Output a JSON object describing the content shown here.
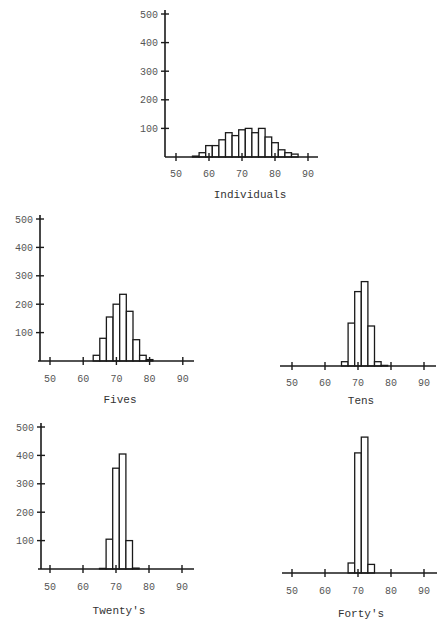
{
  "figure": {
    "width": 445,
    "height": 626,
    "ink_color": "#1a1a1a",
    "label_color": "#555555"
  },
  "chart_data": [
    {
      "type": "bar",
      "title": "Individuals",
      "xlabel": "Individuals",
      "ylabel": "",
      "xticks": [
        50,
        60,
        70,
        80,
        90
      ],
      "yticks": [
        100,
        200,
        300,
        400,
        500
      ],
      "ylim": [
        0,
        500
      ],
      "xlim": [
        47,
        93
      ],
      "show_yaxis": true,
      "bin_width": 2,
      "categories": [
        56,
        58,
        60,
        62,
        64,
        66,
        68,
        70,
        72,
        74,
        76,
        78,
        80,
        82,
        84,
        86
      ],
      "values": [
        3,
        15,
        40,
        40,
        60,
        85,
        75,
        95,
        100,
        85,
        100,
        70,
        50,
        25,
        15,
        10
      ],
      "layout": {
        "axis_x": 165,
        "baseline_y": 157,
        "x50": 176,
        "px_per_10": 33,
        "px_per_100": 28.6,
        "axis_left": 165,
        "axis_right": 318,
        "label_y": 177,
        "title_y": 198,
        "title_x": 250
      }
    },
    {
      "type": "bar",
      "title": "Fives",
      "xlabel": "Fives",
      "ylabel": "",
      "xticks": [
        50,
        60,
        70,
        80,
        90
      ],
      "yticks": [
        100,
        200,
        300,
        400,
        500
      ],
      "ylim": [
        0,
        500
      ],
      "xlim": [
        47,
        93
      ],
      "show_yaxis": true,
      "bin_width": 2,
      "categories": [
        64,
        66,
        68,
        70,
        72,
        74,
        76,
        78,
        80
      ],
      "values": [
        20,
        80,
        155,
        200,
        235,
        175,
        75,
        20,
        5
      ],
      "layout": {
        "axis_x": 40,
        "baseline_y": 361,
        "x50": 50,
        "px_per_10": 33.2,
        "px_per_100": 28.4,
        "axis_left": 38,
        "axis_right": 194,
        "label_y": 382,
        "title_y": 403,
        "title_x": 120
      }
    },
    {
      "type": "bar",
      "title": "Tens",
      "xlabel": "Tens",
      "ylabel": "",
      "xticks": [
        50,
        60,
        70,
        80,
        90
      ],
      "yticks": [],
      "ylim": [
        0,
        500
      ],
      "xlim": [
        47,
        93
      ],
      "show_yaxis": false,
      "bin_width": 2,
      "categories": [
        66,
        68,
        70,
        72,
        74,
        76,
        78
      ],
      "values": [
        15,
        150,
        260,
        295,
        140,
        15,
        2
      ],
      "layout": {
        "axis_x": 280,
        "baseline_y": 366,
        "x50": 292,
        "px_per_10": 33,
        "px_per_100": 28.6,
        "axis_left": 280,
        "axis_right": 436,
        "label_y": 386,
        "title_y": 404,
        "title_x": 361
      }
    },
    {
      "type": "bar",
      "title": "Twenty's",
      "xlabel": "Twenty's",
      "ylabel": "",
      "xticks": [
        50,
        60,
        70,
        80,
        90
      ],
      "yticks": [
        100,
        200,
        300,
        400,
        500
      ],
      "ylim": [
        0,
        500
      ],
      "xlim": [
        47,
        93
      ],
      "show_yaxis": true,
      "bin_width": 2,
      "categories": [
        66,
        68,
        70,
        72,
        74,
        76
      ],
      "values": [
        2,
        105,
        355,
        405,
        100,
        3
      ],
      "layout": {
        "axis_x": 41,
        "baseline_y": 569,
        "x50": 50,
        "px_per_10": 33,
        "px_per_100": 28.4,
        "axis_left": 38,
        "axis_right": 194,
        "label_y": 590,
        "title_y": 614,
        "title_x": 119
      }
    },
    {
      "type": "bar",
      "title": "Forty's",
      "xlabel": "Forty's",
      "ylabel": "",
      "xticks": [
        50,
        60,
        70,
        80,
        90
      ],
      "yticks": [],
      "ylim": [
        0,
        500
      ],
      "xlim": [
        47,
        93
      ],
      "show_yaxis": false,
      "bin_width": 2,
      "categories": [
        68,
        70,
        72,
        74
      ],
      "values": [
        35,
        420,
        475,
        30
      ],
      "layout": {
        "axis_x": 282,
        "baseline_y": 573,
        "x50": 292,
        "px_per_10": 33,
        "px_per_100": 28.6,
        "axis_left": 282,
        "axis_right": 437,
        "label_y": 594,
        "title_y": 617,
        "title_x": 361
      }
    }
  ]
}
